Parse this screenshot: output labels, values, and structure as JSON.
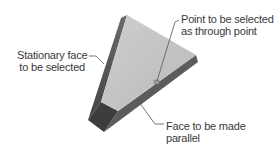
{
  "diagram": {
    "type": "3d-part-illustration",
    "colors": {
      "top_face": "#c4c4c4",
      "left_side_face": "#555555",
      "right_side_face": "#6e6e6e",
      "bottom_face": "#3d3d3d",
      "leader_line": "#555555",
      "point_marker": "#9a9a9a",
      "text": "#3a3a3a"
    },
    "labels": {
      "stationary_face": {
        "line1": "Stationary face",
        "line2": "to be selected"
      },
      "through_point": {
        "line1": "Point to be selected",
        "line2": "as through point"
      },
      "parallel_face": {
        "line1": "Face to be made",
        "line2": "parallel"
      }
    }
  }
}
